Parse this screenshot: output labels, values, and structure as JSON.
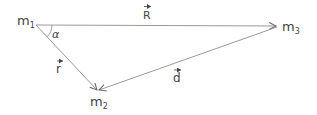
{
  "diagram": {
    "nodes": [
      {
        "id": "m1",
        "label": "m",
        "sub": "1",
        "x": 36,
        "y": 25
      },
      {
        "id": "m2",
        "label": "m",
        "sub": "2",
        "x": 98,
        "y": 91
      },
      {
        "id": "m3",
        "label": "m",
        "sub": "3",
        "x": 277,
        "y": 26
      }
    ],
    "vectors": [
      {
        "id": "R",
        "from": "m1",
        "to": "m3",
        "label": "R"
      },
      {
        "id": "r",
        "from": "m1",
        "to": "m2",
        "label": "r"
      },
      {
        "id": "d",
        "from": "m3",
        "to": "m2",
        "label": "d"
      }
    ],
    "angle": {
      "at": "m1",
      "label": "α"
    },
    "colors": {
      "line": "#9a9a9a",
      "text": "#444444"
    }
  }
}
